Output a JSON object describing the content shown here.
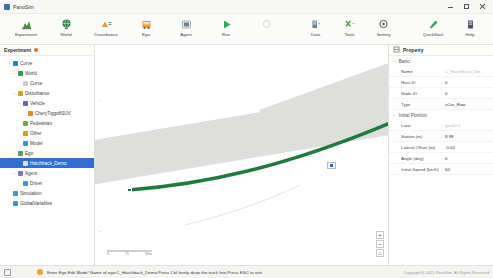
{
  "window": {
    "title": "PanoSim",
    "minimize_label": "minimize",
    "maximize_label": "maximize",
    "close_label": "close"
  },
  "ribbon": {
    "left_items": [
      {
        "label": "Experiment",
        "icon": "experiment-icon"
      },
      {
        "label": "World",
        "icon": "world-icon"
      },
      {
        "label": "Disturbance",
        "icon": "disturbance-icon"
      },
      {
        "label": "Ego",
        "icon": "ego-icon"
      },
      {
        "label": "Agent",
        "icon": "agent-icon"
      },
      {
        "label": "Run",
        "icon": "run-icon"
      }
    ],
    "right_items": [
      {
        "label": "Data",
        "icon": "data-icon"
      },
      {
        "label": "Tools",
        "icon": "tools-icon"
      },
      {
        "label": "Setting",
        "icon": "setting-icon"
      }
    ],
    "far_items": [
      {
        "label": "QuickStart",
        "icon": "quickstart-icon"
      },
      {
        "label": "Help",
        "icon": "help-icon"
      }
    ]
  },
  "tree": {
    "header": "Experiment",
    "nodes": [
      {
        "label": "Curve",
        "depth": 1,
        "twist": "−",
        "color": "#2b7fbf",
        "selected": false
      },
      {
        "label": "World",
        "depth": 2,
        "twist": "−",
        "color": "#2f9e4f",
        "selected": false
      },
      {
        "label": "Curve",
        "depth": 3,
        "twist": "",
        "color": "#cfcfcf",
        "selected": false
      },
      {
        "label": "Disturbance",
        "depth": 2,
        "twist": "−",
        "color": "#c9a227",
        "selected": false
      },
      {
        "label": "Vehicle",
        "depth": 3,
        "twist": "−",
        "color": "#7a5ea8",
        "selected": false
      },
      {
        "label": "CheryTiggo8SUV",
        "depth": 4,
        "twist": "",
        "color": "#e08b2b",
        "selected": false
      },
      {
        "label": "Pedestrian",
        "depth": 3,
        "twist": "",
        "color": "#6aa84f",
        "selected": false
      },
      {
        "label": "Other",
        "depth": 3,
        "twist": "",
        "color": "#c9a227",
        "selected": false
      },
      {
        "label": "Model",
        "depth": 3,
        "twist": "",
        "color": "#4a90c9",
        "selected": false
      },
      {
        "label": "Ego",
        "depth": 2,
        "twist": "−",
        "color": "#4fa36b",
        "selected": false
      },
      {
        "label": "Hatchback_Demo",
        "depth": 3,
        "twist": "",
        "color": "#d8e4f5",
        "selected": true
      },
      {
        "label": "Agent",
        "depth": 2,
        "twist": "−",
        "color": "#8a6fbf",
        "selected": false
      },
      {
        "label": "Driver",
        "depth": 3,
        "twist": "",
        "color": "#4a90c9",
        "selected": false
      },
      {
        "label": "Simulation",
        "depth": 1,
        "twist": "",
        "color": "#4a90c9",
        "selected": false
      },
      {
        "label": "GlobalVariables",
        "depth": 1,
        "twist": "",
        "color": "#4a90c9",
        "selected": false
      }
    ]
  },
  "canvas": {
    "scalebar": {
      "ticks": [
        "0",
        "15",
        "30m"
      ]
    },
    "zoom_in_label": "+",
    "zoom_out_label": "−",
    "zoom_reset_label": "⌂",
    "road_color": "#dededd",
    "track_color": "#1f7a3f"
  },
  "property": {
    "header": "Property",
    "sections": [
      {
        "name": "Basic",
        "rows": [
          {
            "label": "Name",
            "value": "C_Hatchback_Dm",
            "muted": true
          },
          {
            "label": "Host ID",
            "value": "0",
            "muted": false
          },
          {
            "label": "Node ID",
            "value": "0",
            "muted": false
          },
          {
            "label": "Type",
            "value": "vCar_Raw",
            "muted": false
          }
        ]
      },
      {
        "name": "Initial Position",
        "rows": [
          {
            "label": "Lane",
            "value": "geoID:1",
            "muted": true
          },
          {
            "label": "Station (m)",
            "value": "8.99",
            "muted": false
          },
          {
            "label": "Lateral Offset (m)",
            "value": "-0.02",
            "muted": false
          },
          {
            "label": "Angle (deg)",
            "value": "0",
            "muted": false
          },
          {
            "label": "Initial Speed (km/h)",
            "value": "60",
            "muted": false
          }
        ]
      }
    ]
  },
  "statusbar": {
    "message": "Enter Ego Edit Mode! Name of ego:C_Hatchback_Demo,Press Ctrl freely draw the track line,Press ESC to exit",
    "copyright": "Copyright@ 2021 PanoSim. All Rights Reserved"
  }
}
